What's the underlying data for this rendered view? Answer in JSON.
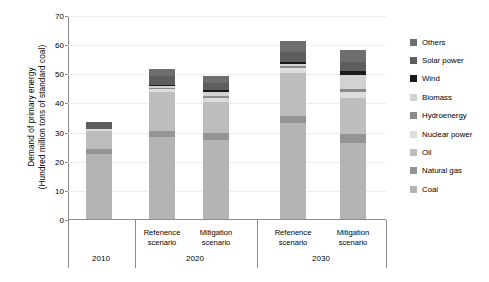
{
  "chart_data": {
    "type": "bar",
    "stacked": true,
    "title": "",
    "xlabel": "",
    "ylabel": "Demand of primary energy\n(Hundred million tons of standard coal)",
    "ylim": [
      0,
      70
    ],
    "yticks": [
      0,
      10,
      20,
      30,
      40,
      50,
      60,
      70
    ],
    "grid": true,
    "legend_position": "right",
    "categories": [
      "2010",
      "Refenence scenario",
      "Mitigation scenario",
      "Refenence scenario",
      "Mitigation scenario"
    ],
    "group_labels": [
      "2010",
      "2020",
      "2030"
    ],
    "scenario_labels": [
      "",
      "Refenence\nscenario",
      "Mitigation\nscenario",
      "Refenence\nscenario",
      "Mitigation\nscenario"
    ],
    "series": [
      {
        "name": "Coal",
        "color": "#b4b4b4",
        "values": [
          22.8,
          28.6,
          27.5,
          33.2,
          26.5
        ]
      },
      {
        "name": "Natural gas",
        "color": "#949494",
        "values": [
          1.6,
          2.1,
          2.2,
          2.6,
          3.0
        ]
      },
      {
        "name": "Oil",
        "color": "#bdbdbd",
        "values": [
          6.2,
          13.1,
          10.8,
          14.8,
          12.4
        ]
      },
      {
        "name": "Nuclear power",
        "color": "#dcdcdc",
        "values": [
          0.5,
          1.2,
          1.5,
          1.6,
          2.2
        ]
      },
      {
        "name": "Hydroenergy",
        "color": "#8a8a8a",
        "values": [
          0.0,
          0.4,
          0.6,
          0.5,
          0.7
        ]
      },
      {
        "name": "Biomass",
        "color": "#d2d2d2",
        "values": [
          0.0,
          0.5,
          1.3,
          0.7,
          5.1
        ]
      },
      {
        "name": "Wind",
        "color": "#1a1a1a",
        "values": [
          0.0,
          0.5,
          0.6,
          0.7,
          1.1
        ]
      },
      {
        "name": "Solar power",
        "color": "#5e5e5e",
        "values": [
          2.4,
          3.1,
          2.6,
          3.6,
          3.2
        ]
      },
      {
        "name": "Others",
        "color": "#6e6e6e",
        "values": [
          0.0,
          2.5,
          2.4,
          3.8,
          4.3
        ]
      }
    ],
    "totals": [
      33.5,
      52.0,
      49.5,
      61.5,
      58.5
    ],
    "legend_entries": [
      {
        "label": "Others",
        "color": "#6e6e6e"
      },
      {
        "label": "Solar power",
        "color": "#5e5e5e"
      },
      {
        "label": "Wind",
        "color": "#1a1a1a"
      },
      {
        "label": "Biomass",
        "color": "#d2d2d2"
      },
      {
        "label": "Hydroenergy",
        "color": "#8a8a8a"
      },
      {
        "label": "Nuclear power",
        "color": "#dcdcdc"
      },
      {
        "label": "Oil",
        "color": "#bdbdbd"
      },
      {
        "label": "Natural gas",
        "color": "#949494"
      },
      {
        "label": "Coal",
        "color": "#b4b4b4"
      }
    ]
  }
}
